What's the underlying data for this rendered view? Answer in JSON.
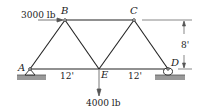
{
  "diagram": {
    "type": "truss",
    "nodes": {
      "A": {
        "label": "A"
      },
      "B": {
        "label": "B"
      },
      "C": {
        "label": "C"
      },
      "D": {
        "label": "D"
      },
      "E": {
        "label": "E"
      }
    },
    "members": [
      "AB",
      "BC",
      "AE",
      "BE",
      "CE",
      "ED",
      "CD"
    ],
    "loads": {
      "horizontal": {
        "label": "3000 lb",
        "at": "B",
        "direction": "right"
      },
      "vertical": {
        "label": "4000 lb",
        "at": "E",
        "direction": "down"
      }
    },
    "dimensions": {
      "height": "8'",
      "span_left": "12'",
      "span_right": "12'"
    },
    "supports": {
      "A": "pin",
      "D": "roller"
    },
    "colors": {
      "line": "#222222",
      "ground": "#9a9a9a"
    }
  }
}
